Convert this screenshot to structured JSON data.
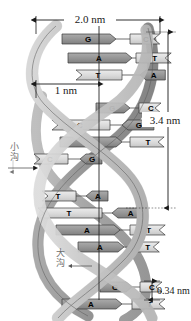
{
  "dimensions": {
    "width_label": "2.0 nm",
    "inner_label": "1 nm",
    "pitch_label": "3.4 nm",
    "rise_label": "0.34 nm"
  },
  "grooves": {
    "minor": "小沟",
    "major": "大沟"
  },
  "colors": {
    "purine_fill": "#9a9a9a",
    "pyrimidine_fill": "#dcdcdc",
    "backbone_light": "#d5d5d5",
    "backbone_dark": "#9e9e9e",
    "outline": "#3a3a3a",
    "dimension_line": "#1a1a1a"
  },
  "base_pairs": [
    {
      "y": 39,
      "left": "G",
      "right": "C",
      "left_type": "purine",
      "right_type": "pyrimidine",
      "x1": 62,
      "x2": 130,
      "w": 54
    },
    {
      "y": 58,
      "left": "A",
      "right": "T",
      "left_type": "purine",
      "right_type": "pyrimidine",
      "x1": 68,
      "x2": 136,
      "w": 64
    },
    {
      "y": 75,
      "left": "T",
      "right": "A",
      "left_type": "pyrimidine",
      "right_type": "purine",
      "x1": 76,
      "x2": 140,
      "w": 46
    },
    {
      "y": 108,
      "left": "G",
      "right": "C",
      "left_type": "purine",
      "right_type": "pyrimidine",
      "x1": 96,
      "x2": 139,
      "w": 34
    },
    {
      "y": 125,
      "left": "C",
      "right": "G",
      "left_type": "pyrimidine",
      "right_type": "purine",
      "x1": 52,
      "x2": 122,
      "w": 58
    },
    {
      "y": 142,
      "left": "A",
      "right": "T",
      "left_type": "purine",
      "right_type": "pyrimidine",
      "x1": 60,
      "x2": 130,
      "w": 62
    },
    {
      "y": 159,
      "left": "C",
      "right": "G",
      "left_type": "pyrimidine",
      "right_type": "purine",
      "x1": 34,
      "x2": 80,
      "w": 34
    },
    {
      "y": 196,
      "left": "T",
      "right": "A",
      "left_type": "pyrimidine",
      "right_type": "purine",
      "x1": 42,
      "x2": 86,
      "w": 34
    },
    {
      "y": 213,
      "left": "T",
      "right": "A",
      "left_type": "pyrimidine",
      "right_type": "purine",
      "x1": 38,
      "x2": 112,
      "w": 64
    },
    {
      "y": 230,
      "left": "A",
      "right": "T",
      "left_type": "purine",
      "right_type": "pyrimidine",
      "x1": 56,
      "x2": 130,
      "w": 64
    },
    {
      "y": 247,
      "left": "A",
      "right": "T",
      "left_type": "purine",
      "right_type": "pyrimidine",
      "x1": 78,
      "x2": 134,
      "w": 46
    },
    {
      "y": 287,
      "left": "G",
      "right": "C",
      "left_type": "purine",
      "right_type": "pyrimidine",
      "x1": 100,
      "x2": 140,
      "w": 32
    },
    {
      "y": 304,
      "left": "A",
      "right": "T",
      "left_type": "purine",
      "right_type": "pyrimidine",
      "x1": 62,
      "x2": 132,
      "w": 60
    }
  ]
}
